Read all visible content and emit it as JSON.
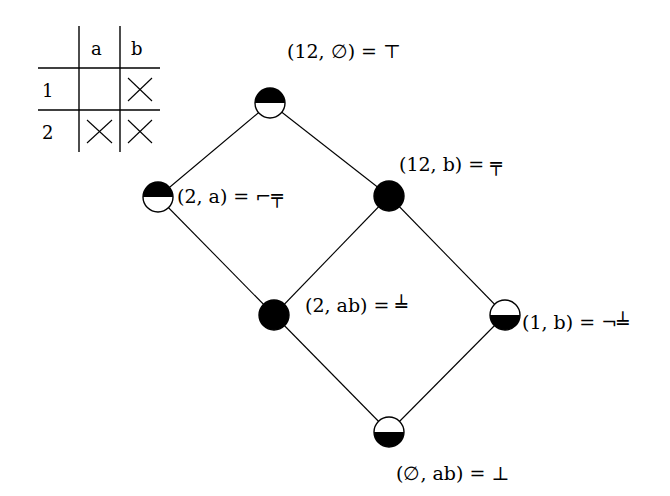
{
  "table": {
    "columns": [
      "a",
      "b"
    ],
    "rows": [
      {
        "label": "1",
        "cells": [
          "",
          "X"
        ]
      },
      {
        "label": "2",
        "cells": [
          "X",
          "X"
        ]
      }
    ]
  },
  "lattice": {
    "nodes": [
      {
        "id": "top",
        "label": "(12, ∅) = ⊤",
        "x": 270,
        "y": 103,
        "fill": "top-half"
      },
      {
        "id": "left",
        "label": "(2, a) = ⌐╤",
        "x": 158,
        "y": 197,
        "fill": "top-half"
      },
      {
        "id": "mid-right",
        "label": "(12, b) = ╤",
        "x": 389,
        "y": 196,
        "fill": "full"
      },
      {
        "id": "center",
        "label": "(2, ab) = ╧",
        "x": 274,
        "y": 315,
        "fill": "full"
      },
      {
        "id": "right",
        "label": "(1, b) = ¬╧",
        "x": 505,
        "y": 315,
        "fill": "bottom-half"
      },
      {
        "id": "bottom",
        "label": "(∅, ab) = ⊥",
        "x": 389,
        "y": 432,
        "fill": "bottom-half"
      }
    ],
    "edges": [
      [
        "top",
        "left"
      ],
      [
        "top",
        "mid-right"
      ],
      [
        "left",
        "center"
      ],
      [
        "mid-right",
        "center"
      ],
      [
        "mid-right",
        "right"
      ],
      [
        "center",
        "bottom"
      ],
      [
        "right",
        "bottom"
      ]
    ]
  },
  "labels": {
    "top": "(12, ∅) = ⊤",
    "left": "(2, a) = ⌐╤",
    "mid_right": "(12, b) = ╤",
    "center": "(2, ab) = ╧",
    "right": "(1, b) = ¬╧",
    "bottom": "(∅, ab) = ⊥"
  }
}
